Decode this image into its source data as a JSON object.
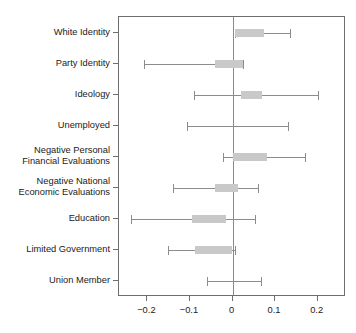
{
  "chart_data": {
    "type": "scatter",
    "title": "",
    "subtitle": "",
    "xlabel": "",
    "ylabel": "",
    "xlim": [
      -0.2667,
      0.2667
    ],
    "ylim": [
      0,
      9
    ],
    "grid": false,
    "legend": null,
    "zero_reference_line": 0,
    "xticks": [
      -0.2,
      -0.1,
      0,
      0.1,
      0.2
    ],
    "xticklabels": [
      "−0.2",
      "−0.1",
      "0",
      "0.1",
      "0.2"
    ],
    "categories": [
      "White Identity",
      "Party Identity",
      "Ideology",
      "Unemployed",
      "Negative Personal\nFinancial Evaluations",
      "Negative National\nEconomic Evaluations",
      "Education",
      "Limited Government",
      "Union Member"
    ],
    "series": [
      {
        "name": "Coefficient estimate with confidence interval",
        "points": [
          {
            "label": "White Identity",
            "estimate": 0.06,
            "box_low": 0.005,
            "box_high": 0.073,
            "ci_low": 0.005,
            "ci_high": 0.135
          },
          {
            "label": "Party Identity",
            "estimate": -0.03,
            "box_low": -0.04,
            "box_high": 0.025,
            "ci_low": -0.208,
            "ci_high": 0.025
          },
          {
            "label": "Ideology",
            "estimate": 0.025,
            "box_low": 0.019,
            "box_high": 0.07,
            "ci_low": -0.091,
            "ci_high": 0.201
          },
          {
            "label": "Unemployed",
            "estimate": 0.0,
            "box_low": 0.0,
            "box_high": 0.0,
            "ci_low": -0.108,
            "ci_high": 0.131
          },
          {
            "label": "Negative Personal Financial Evaluations",
            "estimate": 0.05,
            "box_low": 0.0,
            "box_high": 0.082,
            "ci_low": -0.023,
            "ci_high": 0.171
          },
          {
            "label": "Negative National Economic Evaluations",
            "estimate": -0.025,
            "box_low": -0.04,
            "box_high": 0.014,
            "ci_low": -0.14,
            "ci_high": 0.061
          },
          {
            "label": "Education",
            "estimate": -0.06,
            "box_low": -0.094,
            "box_high": -0.016,
            "ci_low": -0.239,
            "ci_high": 0.054
          },
          {
            "label": "Limited Government",
            "estimate": -0.045,
            "box_low": -0.087,
            "box_high": 0.0,
            "ci_low": -0.152,
            "ci_high": 0.005
          },
          {
            "label": "Union Member",
            "estimate": 0.0,
            "box_low": 0.0,
            "box_high": 0.0,
            "ci_low": -0.061,
            "ci_high": 0.066
          }
        ]
      }
    ],
    "colors": {
      "box_fill": "#c9c9c9",
      "whisker": "#8c8c8c",
      "axis": "#6e6e6e",
      "zero_line": "#8a8a8a",
      "text": "#1a1a1a",
      "background": "#ffffff"
    }
  }
}
